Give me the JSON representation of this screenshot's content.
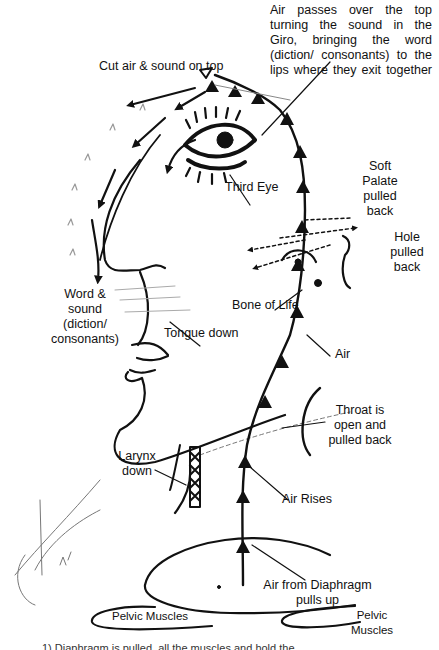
{
  "diagram": {
    "colors": {
      "ink": "#111111",
      "faint": "#9a9a9a",
      "background": "#ffffff"
    },
    "labels": {
      "air_passes": [
        "Air passes over the top",
        "turning the sound in the",
        "Giro, bringing the word",
        "(diction/ consonants) to the",
        "lips where they exit together"
      ],
      "cut_air": "Cut air & sound on top",
      "third_eye": "Third Eye",
      "soft_palate": [
        "Soft",
        "Palate",
        "pulled",
        "back"
      ],
      "hole": [
        "Hole",
        "pulled",
        "back"
      ],
      "word_sound": [
        "Word &",
        "sound",
        "(diction/",
        "consonants)"
      ],
      "bone_of_life": "Bone of Life",
      "tongue_down": "Tongue down",
      "air": "Air",
      "throat": [
        "Throat is",
        "open and",
        "pulled back"
      ],
      "larynx": [
        "Larynx",
        "down"
      ],
      "air_rises": "Air Rises",
      "air_from_diaphragm": [
        "Air from Diaphragm",
        "pulls up"
      ],
      "pelvic_left": "Pelvic Muscles",
      "pelvic_right": [
        "Pelvic",
        "Muscles"
      ],
      "caption_cut": "1) Diaphragm is pulled, all the muscles and hold the..."
    }
  }
}
